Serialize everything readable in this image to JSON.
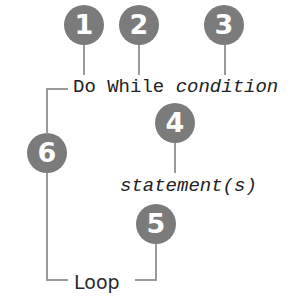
{
  "diagram": {
    "colors": {
      "badge": "#7b7b7b",
      "badge_text": "#ffffff",
      "connector": "#9a9a9a",
      "text": "#222222"
    },
    "code": {
      "line1": {
        "keyword_do": "Do",
        "keyword_while": "While",
        "placeholder_condition": "condition"
      },
      "line2": {
        "placeholder_statements": "statement(s)"
      },
      "line3": {
        "keyword_loop": "Loop"
      }
    },
    "callouts": [
      {
        "number": "1",
        "points_to": "Do"
      },
      {
        "number": "2",
        "points_to": "While"
      },
      {
        "number": "3",
        "points_to": "condition"
      },
      {
        "number": "4",
        "points_to": "statement(s)"
      },
      {
        "number": "5",
        "points_to": "Loop"
      },
      {
        "number": "6",
        "points_to": "Do ... Loop block"
      }
    ]
  }
}
